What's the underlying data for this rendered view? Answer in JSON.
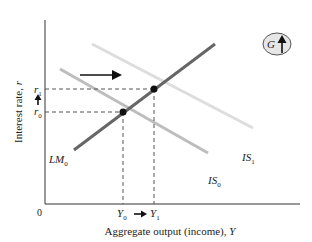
{
  "diagram": {
    "type": "IS-LM",
    "y_axis_label": "Interest rate, r",
    "x_axis_label": "Aggregate output (income), Y",
    "origin_label": "0",
    "curves": {
      "lm": {
        "name": "LM",
        "sub": "0"
      },
      "is0": {
        "name": "IS",
        "sub": "0"
      },
      "is1": {
        "name": "IS",
        "sub": "1"
      }
    },
    "r_ticks": {
      "r0": {
        "name": "r",
        "sub": "0"
      },
      "r1": {
        "name": "r",
        "sub": "1"
      }
    },
    "y_ticks": {
      "y0": {
        "name": "Y",
        "sub": "0"
      },
      "y1": {
        "name": "Y",
        "sub": "1"
      }
    },
    "badge": {
      "label": "G",
      "icon": "up-arrow-icon"
    },
    "colors": {
      "lm": "#666666",
      "is0": "#bdbdbd",
      "is1": "#dddddd",
      "axis": "#333333",
      "badge_fill": "#e6e6e6"
    }
  }
}
